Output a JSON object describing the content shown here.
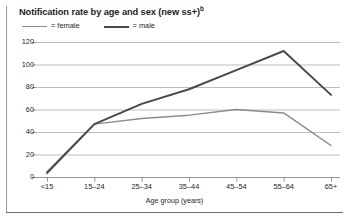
{
  "figure": {
    "title": "Notification rate by age and sex (new ss+)",
    "title_superscript": "b"
  },
  "legend": {
    "position": "top-left",
    "entries": [
      {
        "label": "= female",
        "name": "female",
        "color": "#8c8c8c"
      },
      {
        "label": "= male",
        "name": "male",
        "color": "#4a4a4a"
      }
    ]
  },
  "axes": {
    "x_title": "Age group (years)",
    "y_title": "",
    "y_ticks": [
      "120",
      "100",
      "80",
      "60",
      "40",
      "20",
      "0"
    ],
    "x_ticks": [
      "<15",
      "15–24",
      "25–34",
      "35–44",
      "45–54",
      "55–64",
      "65+"
    ]
  },
  "chart_data": {
    "type": "line",
    "title": "Notification rate by age and sex (new ss+)",
    "xlabel": "Age group (years)",
    "ylabel": "",
    "categories": [
      "<15",
      "15–24",
      "25–34",
      "35–44",
      "45–54",
      "55–64",
      "65+"
    ],
    "series": [
      {
        "name": "female",
        "color": "#8c8c8c",
        "values": [
          3,
          47,
          52,
          55,
          60,
          57,
          28
        ]
      },
      {
        "name": "male",
        "color": "#4a4a4a",
        "values": [
          4,
          47,
          65,
          78,
          95,
          112,
          73
        ]
      }
    ],
    "ylim": [
      0,
      120
    ],
    "ytick_step": 20,
    "grid": true,
    "grid_axis": "y",
    "legend_position": "top-left"
  },
  "style": {
    "grid_color": "#b5b5b5",
    "axis_color": "#8a8a8a",
    "text_color": "#231f20"
  }
}
